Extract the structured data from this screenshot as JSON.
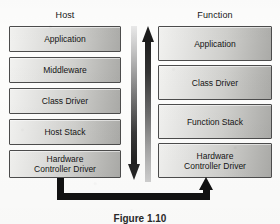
{
  "figure": {
    "caption": "Figure 1.10",
    "columns": [
      {
        "id": "host",
        "title": "Host",
        "layers": [
          {
            "label": "Application"
          },
          {
            "label": "Middleware"
          },
          {
            "label": "Class Driver"
          },
          {
            "label": "Host Stack"
          },
          {
            "label": "Hardware",
            "label2": "Controller Driver"
          }
        ]
      },
      {
        "id": "function",
        "title": "Function",
        "layers": [
          {
            "label": "Application"
          },
          {
            "label": "Class Driver"
          },
          {
            "label": "Function Stack"
          },
          {
            "label": "Hardware",
            "label2": "Controller Driver"
          }
        ]
      }
    ],
    "arrows": {
      "down": {
        "name": "downstream-arrow",
        "direction": "down"
      },
      "up": {
        "name": "upstream-arrow",
        "direction": "up"
      },
      "feedback": {
        "name": "return-path-arrow",
        "direction": "right-up"
      }
    },
    "colors": {
      "box_fill_light": "#f2f2f0",
      "box_fill_dark": "#aaaaa7",
      "box_border": "#4c4c4c",
      "arrow_dark": "#1c1c1c",
      "background": "#fdfdfc",
      "text": "#141414"
    }
  }
}
